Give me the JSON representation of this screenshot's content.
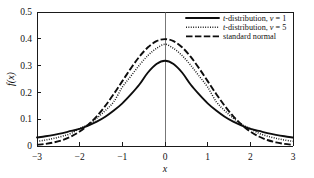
{
  "chart_data": {
    "type": "line",
    "title": "",
    "xlabel": "x",
    "ylabel": "f(x)",
    "xlim": [
      -3,
      3
    ],
    "ylim": [
      0,
      0.5
    ],
    "grid": false,
    "legend_position": "top-right",
    "xticks": [
      "−3",
      "−2",
      "−1",
      "0",
      "1",
      "2",
      "3"
    ],
    "xtick_values": [
      -3,
      -2,
      -1,
      0,
      1,
      2,
      3
    ],
    "yticks": [
      "0",
      "0.1",
      "0.2",
      "0.3",
      "0.4",
      "0.5"
    ],
    "ytick_values": [
      0,
      0.1,
      0.2,
      0.3,
      0.4,
      0.5
    ],
    "x": [
      -3,
      -2.8,
      -2.6,
      -2.4,
      -2.2,
      -2,
      -1.8,
      -1.6,
      -1.4,
      -1.2,
      -1,
      -0.8,
      -0.6,
      -0.4,
      -0.2,
      0,
      0.2,
      0.4,
      0.6,
      0.8,
      1,
      1.2,
      1.4,
      1.6,
      1.8,
      2,
      2.2,
      2.4,
      2.6,
      2.8,
      3
    ],
    "series": [
      {
        "name": "t-distribution, ν = 1",
        "style": "solid",
        "peak": 0.318,
        "values": [
          0.0318,
          0.0362,
          0.0416,
          0.0481,
          0.0562,
          0.0637,
          0.0761,
          0.0908,
          0.1092,
          0.1323,
          0.1592,
          0.1924,
          0.2294,
          0.2743,
          0.306,
          0.3183,
          0.306,
          0.2743,
          0.2294,
          0.1924,
          0.1592,
          0.1323,
          0.1092,
          0.0908,
          0.0761,
          0.0637,
          0.0562,
          0.0481,
          0.0416,
          0.0362,
          0.0318
        ]
      },
      {
        "name": "t-distribution, ν = 5",
        "style": "dotted",
        "peak": 0.38,
        "values": [
          0.0173,
          0.0222,
          0.0286,
          0.0368,
          0.0474,
          0.0651,
          0.0804,
          0.1037,
          0.1321,
          0.1652,
          0.2197,
          0.2608,
          0.3017,
          0.3377,
          0.3643,
          0.3796,
          0.3643,
          0.3377,
          0.3017,
          0.2608,
          0.2197,
          0.1652,
          0.1321,
          0.1037,
          0.0804,
          0.0651,
          0.0474,
          0.0368,
          0.0286,
          0.0222,
          0.0173
        ]
      },
      {
        "name": "standard normal",
        "style": "dashed",
        "peak": 0.399,
        "values": [
          0.0044,
          0.0079,
          0.0136,
          0.0224,
          0.0355,
          0.054,
          0.079,
          0.1109,
          0.1497,
          0.1942,
          0.242,
          0.2897,
          0.3332,
          0.3683,
          0.391,
          0.3989,
          0.391,
          0.3683,
          0.3332,
          0.2897,
          0.242,
          0.1942,
          0.1497,
          0.1109,
          0.079,
          0.054,
          0.0355,
          0.0224,
          0.0136,
          0.0079,
          0.0044
        ]
      }
    ]
  },
  "legend": {
    "items": [
      {
        "label": "t-distribution, ν = 1",
        "style": "solid"
      },
      {
        "label": "t-distribution, ν = 5",
        "style": "dotted"
      },
      {
        "label": "standard normal",
        "style": "dashed"
      }
    ]
  },
  "colors": {
    "line": "#0d0d0d",
    "frame": "#1a1a1a",
    "background": "#ffffff",
    "center_line": "#555555"
  }
}
